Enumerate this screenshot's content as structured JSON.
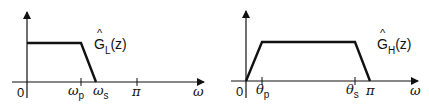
{
  "figure": {
    "line_color": "#111111",
    "left_plot": {
      "name": "lowpass",
      "curve_label": {
        "base": "G",
        "hat": "^",
        "subscript": "L",
        "arg": "(z)"
      },
      "x_axis_label": "ω",
      "origin_label": "0",
      "ticks": [
        {
          "symbol": "ω",
          "subscript": "p"
        },
        {
          "symbol": "ω",
          "subscript": "s"
        },
        {
          "symbol": "π",
          "subscript": ""
        }
      ]
    },
    "right_plot": {
      "name": "highpass",
      "curve_label": {
        "base": "G",
        "hat": "^",
        "subscript": "H",
        "arg": "(z)"
      },
      "x_axis_label": "ω",
      "origin_label": "0",
      "ticks": [
        {
          "symbol": "θ",
          "subscript": "p"
        },
        {
          "symbol": "θ",
          "subscript": "s"
        },
        {
          "symbol": "π",
          "subscript": ""
        }
      ]
    }
  }
}
